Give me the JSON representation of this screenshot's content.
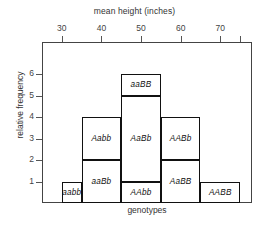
{
  "chart_data": {
    "type": "bar",
    "title": "mean height (inches)",
    "xlabel": "genotypes",
    "ylabel": "relative frequency",
    "top_axis_label": "mean height (inches)",
    "grid": false,
    "legend": "none",
    "xlim": [
      25,
      78
    ],
    "ylim": [
      0,
      6.6
    ],
    "xticks": [
      30,
      40,
      50,
      60,
      70
    ],
    "xtick_labels": [
      "30",
      "40",
      "50",
      "60",
      "70"
    ],
    "yticks": [
      1,
      2,
      3,
      4,
      5,
      6
    ],
    "ytick_labels": [
      "1",
      "2",
      "3",
      "4",
      "5",
      "6"
    ],
    "categories": [
      "aabb",
      "aaBb + Aabb",
      "AAbb + AaBb + aaBB",
      "AaBB + AABb",
      "AABB"
    ],
    "values": [
      1,
      4,
      6,
      4,
      1
    ],
    "bars": [
      {
        "name": "bar-1",
        "x_start": 30,
        "x_end": 35,
        "total": 1,
        "segments": [
          {
            "label": "aabb",
            "from": 0,
            "to": 1
          }
        ]
      },
      {
        "name": "bar-2",
        "x_start": 35,
        "x_end": 45,
        "total": 4,
        "segments": [
          {
            "label": "aaBb",
            "from": 0,
            "to": 2
          },
          {
            "label": "Aabb",
            "from": 2,
            "to": 4
          }
        ]
      },
      {
        "name": "bar-3",
        "x_start": 45,
        "x_end": 55,
        "total": 6,
        "segments": [
          {
            "label": "AAbb",
            "from": 0,
            "to": 1
          },
          {
            "label": "AaBb",
            "from": 1,
            "to": 5
          },
          {
            "label": "aaBB",
            "from": 5,
            "to": 6
          }
        ]
      },
      {
        "name": "bar-4",
        "x_start": 55,
        "x_end": 65,
        "total": 4,
        "segments": [
          {
            "label": "AaBB",
            "from": 0,
            "to": 2
          },
          {
            "label": "AABb",
            "from": 2,
            "to": 4
          }
        ]
      },
      {
        "name": "bar-5",
        "x_start": 65,
        "x_end": 75,
        "total": 1,
        "segments": [
          {
            "label": "AABB",
            "from": 0,
            "to": 1
          }
        ]
      }
    ],
    "colors": {
      "bar_stroke": "#111111",
      "bar_fill": "#ffffff",
      "axis": "#444444",
      "text": "#333333",
      "background": "#ffffff"
    }
  }
}
